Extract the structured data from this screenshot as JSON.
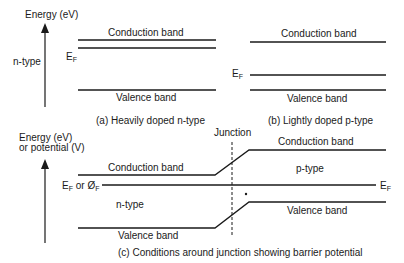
{
  "panel_a": {
    "axis_label": "Energy (eV)",
    "side_label": "n-type",
    "conduction_label": "Conduction band",
    "fermi_label": "E",
    "fermi_sub": "F",
    "valence_label": "Valence band",
    "caption": "(a) Heavily doped n-type"
  },
  "panel_b": {
    "conduction_label": "Conduction band",
    "fermi_label": "E",
    "fermi_sub": "F",
    "valence_label": "Valence band",
    "caption": "(b) Lightly doped p-type"
  },
  "panel_c": {
    "axis_label_line1": "Energy (eV)",
    "axis_label_line2": "or potential (V)",
    "junction_label": "Junction",
    "conduction_label_left": "Conduction band",
    "conduction_label_right": "Conduction band",
    "fermi_label_left": "E",
    "fermi_sub_left": "F",
    "fermi_or": " or Ø",
    "fermi_sub_phi": "F",
    "fermi_label_right": "E",
    "fermi_sub_right": "F",
    "p_type_label": "p-type",
    "n_type_label": "n-type",
    "valence_label_left": "Valence band",
    "valence_label_right": "Valence band",
    "caption": "(c) Conditions around junction showing barrier potential"
  }
}
